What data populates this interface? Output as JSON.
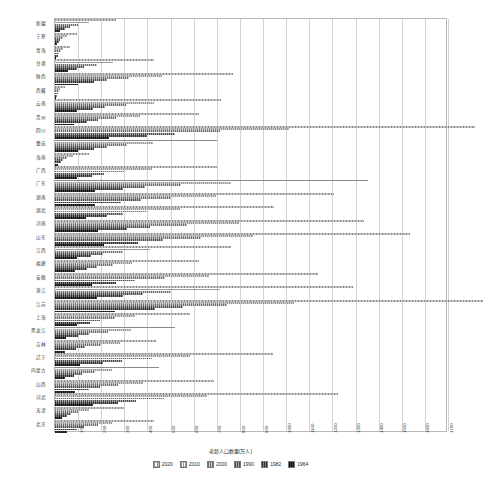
{
  "chart_data": {
    "type": "bar",
    "orientation": "horizontal",
    "title": "",
    "xlabel": "老龄人口数量(万人)",
    "ylabel": "",
    "xlim": [
      0,
      1700
    ],
    "xticks": [
      0,
      100,
      200,
      300,
      400,
      500,
      600,
      700,
      800,
      900,
      1000,
      1100,
      1200,
      1300,
      1400,
      1500,
      1600,
      1700
    ],
    "grid": true,
    "legend_position": "bottom",
    "categories": [
      "北京",
      "天津",
      "河北",
      "山西",
      "内蒙古",
      "辽宁",
      "吉林",
      "黑龙江",
      "上海",
      "江苏",
      "浙江",
      "安徽",
      "福建",
      "江西",
      "山东",
      "河南",
      "湖北",
      "湖南",
      "广东",
      "广西",
      "海南",
      "重庆",
      "四川",
      "贵州",
      "云南",
      "西藏",
      "陕西",
      "甘肃",
      "青海",
      "宁夏",
      "新疆"
    ],
    "series": [
      {
        "name": "2020",
        "values": [
          429,
          300,
          1225,
          686,
          448,
          945,
          435,
          520,
          582,
          1851,
          1287,
          1137,
          624,
          761,
          1536,
          1335,
          948,
          1209,
          1356,
          701,
          147,
          701,
          1817,
          625,
          718,
          42,
          770,
          430,
          67,
          95,
          266
        ]
      },
      {
        "name": "2010",
        "values": [
          246,
          149,
          657,
          382,
          247,
          584,
          281,
          328,
          347,
          1033,
          712,
          664,
          335,
          412,
          858,
          794,
          540,
          696,
          761,
          418,
          78,
          426,
          1011,
          366,
          428,
          23,
          461,
          253,
          35,
          50,
          148
        ]
      },
      {
        "name": "2000",
        "values": [
          188,
          100,
          470,
          274,
          172,
          420,
          197,
          230,
          261,
          744,
          502,
          475,
          250,
          295,
          630,
          570,
          400,
          500,
          546,
          300,
          52,
          311,
          714,
          262,
          309,
          16,
          320,
          181,
          24,
          35,
          100
        ]
      },
      {
        "name": "1990",
        "values": [
          127,
          70,
          352,
          196,
          116,
          290,
          131,
          148,
          193,
          554,
          382,
          345,
          182,
          206,
          466,
          412,
          293,
          373,
          390,
          214,
          34,
          224,
          520,
          186,
          218,
          11,
          226,
          127,
          16,
          23,
          64
        ]
      },
      {
        "name": "1982",
        "values": [
          94,
          53,
          273,
          147,
          84,
          207,
          92,
          100,
          152,
          432,
          296,
          262,
          140,
          157,
          361,
          312,
          224,
          287,
          296,
          161,
          24,
          170,
          396,
          139,
          163,
          8,
          170,
          94,
          11,
          16,
          44
        ]
      },
      {
        "name": "1964",
        "values": [
          50,
          29,
          163,
          88,
          45,
          110,
          45,
          48,
          94,
          259,
          180,
          160,
          86,
          95,
          214,
          184,
          136,
          173,
          172,
          94,
          12,
          100,
          232,
          81,
          95,
          5,
          100,
          55,
          6,
          9,
          22
        ]
      }
    ]
  },
  "legend": {
    "items": [
      {
        "label": "2020",
        "series_index": 0
      },
      {
        "label": "2010",
        "series_index": 1
      },
      {
        "label": "2000",
        "series_index": 2
      },
      {
        "label": "1990",
        "series_index": 3
      },
      {
        "label": "1982",
        "series_index": 4
      },
      {
        "label": "1964",
        "series_index": 5
      }
    ]
  }
}
